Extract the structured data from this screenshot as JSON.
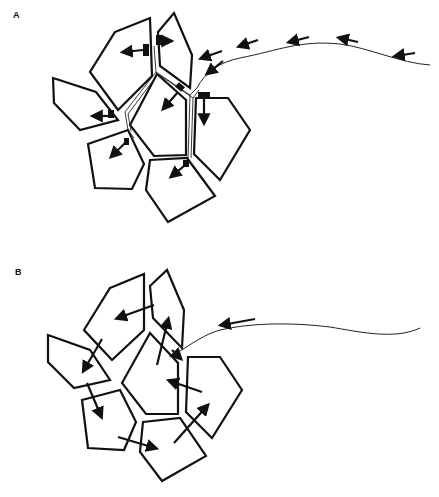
{
  "figure": {
    "panels": [
      {
        "id": "A",
        "label": "A",
        "description": "Single incoming fibre with arrows pointing along it toward a cluster of seven polygonal cells; fibre branches between cells with terminal boutons and arrows pointing into each cell."
      },
      {
        "id": "B",
        "label": "B",
        "description": "Cluster of seven polygonal cells with an incoming fibre ending at the cluster; arrows point from cell to cell indicating propagation within the cluster."
      }
    ],
    "icons": {
      "arrow": "arrow-icon",
      "bouton": "bouton-terminal"
    },
    "colors": {
      "stroke": "#111111",
      "background": "#ffffff"
    }
  }
}
